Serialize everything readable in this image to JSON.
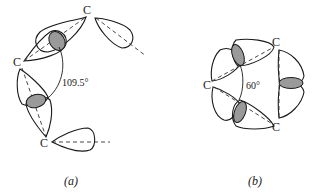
{
  "panel_a": {
    "carbon_labels": [
      "C",
      "C",
      "C"
    ],
    "angle_label": "109.5°",
    "caption": "(a)"
  },
  "panel_b": {
    "carbon_labels": [
      "C",
      "C",
      "C"
    ],
    "angle_label": "60°",
    "caption": "(b)"
  },
  "colors": {
    "stroke": "#1a1a1a",
    "overlap_shade": "#9a9a9a",
    "background": "#ffffff"
  }
}
